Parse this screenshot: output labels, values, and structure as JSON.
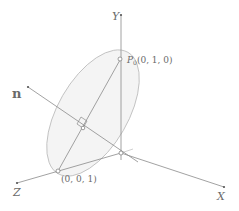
{
  "diagram": {
    "axes": {
      "x_label": "X",
      "y_label": "Y",
      "z_label": "Z"
    },
    "normal_label": "n",
    "points": {
      "p0": {
        "name": "P",
        "subscript": "0",
        "coords": "(0, 1, 0)"
      },
      "p_z": {
        "coords": "(0, 0, 1)"
      }
    },
    "colors": {
      "line": "#8a8a8a",
      "ellipse_fill": "#f3f3f3",
      "ellipse_stroke": "#bdbdbd",
      "text": "#6a6a6a"
    }
  }
}
